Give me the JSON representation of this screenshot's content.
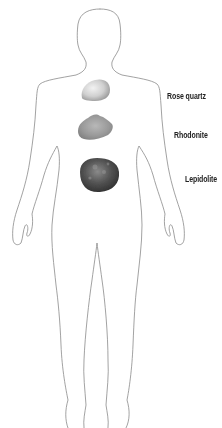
{
  "diagram": {
    "outline_color": "#8a8a8a",
    "stones": [
      {
        "name": "Rose quartz",
        "position": "upper chest",
        "color": "#c9c9c9"
      },
      {
        "name": "Rhodonite",
        "position": "solar plexus",
        "color": "#9a9a9a"
      },
      {
        "name": "Lepidolite",
        "position": "abdomen",
        "color": "#4a4a4a"
      }
    ]
  },
  "labels": {
    "rose_quartz": "Rose quartz",
    "rhodonite": "Rhodonite",
    "lepidolite": "Lepidolite"
  }
}
